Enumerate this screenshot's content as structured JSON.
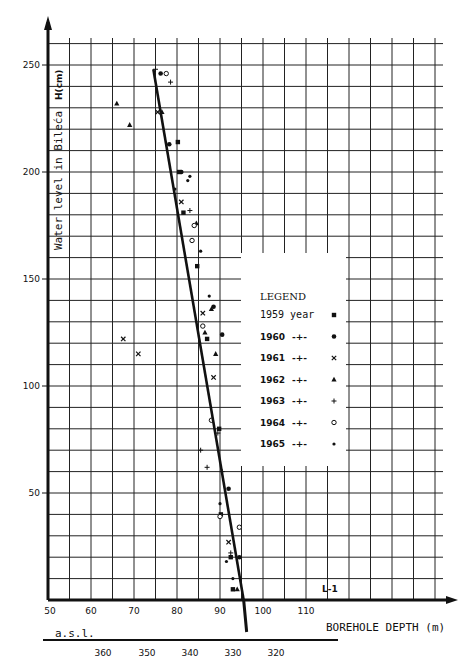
{
  "chart_data": {
    "type": "scatter",
    "title": "",
    "ylabel": "Water level in Bileća",
    "yunit": "H(cm)",
    "xlabel": "BOREHOLE DEPTH (m)",
    "secondary_xlabel": "a.s.l.",
    "annotation": "L-1",
    "xlim": [
      50,
      117
    ],
    "ylim": [
      0,
      260
    ],
    "grid": true,
    "x_ticks": [
      "50",
      "60",
      "70",
      "80",
      "90",
      "100",
      "110"
    ],
    "x_tick_values": [
      50,
      60,
      70,
      80,
      90,
      100,
      110
    ],
    "secondary_x_ticks": [
      "360",
      "350",
      "340",
      "330",
      "320"
    ],
    "y_ticks": [
      "50",
      "100",
      "150",
      "200",
      "250"
    ],
    "y_tick_values": [
      50,
      100,
      150,
      200,
      250
    ],
    "legend": {
      "title": "LEGEND",
      "position": "center-right",
      "entries": [
        {
          "label": "1959 year",
          "marker": "square"
        },
        {
          "label": "1960",
          "marker": "filled-circle"
        },
        {
          "label": "1961",
          "marker": "x"
        },
        {
          "label": "1962",
          "marker": "triangle"
        },
        {
          "label": "1963",
          "marker": "plus"
        },
        {
          "label": "1964",
          "marker": "open-circle"
        },
        {
          "label": "1965",
          "marker": "dot"
        }
      ]
    },
    "trend_line": {
      "x": [
        74.5,
        95.5
      ],
      "y": [
        248,
        0
      ]
    },
    "series": [
      {
        "name": "1959",
        "x": [
          80.2,
          80.5,
          81.5,
          84.7,
          87.0,
          89.8,
          90.2,
          92.5,
          93.0
        ],
        "y": [
          214,
          200,
          181,
          156,
          122,
          80,
          40,
          20,
          5
        ]
      },
      {
        "name": "1960",
        "x": [
          76.2,
          78.2,
          81.0,
          88.5,
          90.5,
          92.0,
          94.5
        ],
        "y": [
          246,
          213,
          200,
          137,
          124,
          52,
          20
        ]
      },
      {
        "name": "1961",
        "x": [
          67.5,
          71.0,
          75.5,
          81.0,
          86.0,
          88.5,
          92.0
        ],
        "y": [
          122,
          115,
          228,
          186,
          134,
          104,
          27
        ]
      },
      {
        "name": "1962",
        "x": [
          66.0,
          69.0,
          76.5,
          84.5,
          86.5,
          88.0,
          89.0,
          94.0
        ],
        "y": [
          232,
          222,
          228,
          176,
          125,
          136,
          115,
          5
        ]
      },
      {
        "name": "1963",
        "x": [
          75.0,
          78.5,
          83.0,
          85.5,
          87.0,
          89.5,
          90.5,
          92.5
        ],
        "y": [
          248,
          242,
          182,
          70,
          62,
          78,
          60,
          22
        ]
      },
      {
        "name": "1964",
        "x": [
          77.5,
          83.5,
          84.0,
          86.0,
          88.0,
          90.0,
          94.5
        ],
        "y": [
          246,
          168,
          175,
          128,
          84,
          39,
          34
        ]
      },
      {
        "name": "1965",
        "x": [
          79.5,
          82.5,
          83.0,
          85.5,
          87.5,
          90.0,
          91.5,
          93.0
        ],
        "y": [
          192,
          196,
          198,
          163,
          142,
          45,
          18,
          10
        ]
      }
    ]
  }
}
